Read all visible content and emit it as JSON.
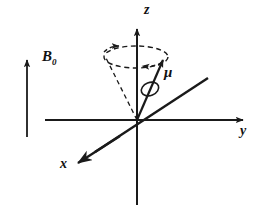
{
  "figure": {
    "name": "larmor-precession-diagram",
    "background": "#ffffff",
    "ink": "#1a1a1a"
  },
  "axes": {
    "z": {
      "label": "z",
      "icon": "axis-arrow-up",
      "x": 147,
      "y": 4
    },
    "y": {
      "label": "y",
      "icon": "axis-arrow-right",
      "x": 243,
      "y": 131
    },
    "x": {
      "label": "x",
      "icon": "axis-arrow-down-left",
      "x": 64,
      "y": 163
    }
  },
  "field": {
    "label": "B",
    "subscript": "0",
    "name": "static-magnetic-field",
    "icon": "field-arrow-up",
    "label_x": 44,
    "label_y": 50
  },
  "moment": {
    "label": "μ",
    "name": "magnetic-moment-vector",
    "icon": "moment-arrow",
    "label_x": 165,
    "label_y": 72
  },
  "precession": {
    "name": "precession-cone",
    "ellipse_label": "precession-circle",
    "arrow_outer": "precession-arrow-cw-far",
    "arrow_inner": "precession-arrow-near",
    "style": "dashed"
  },
  "spin": {
    "name": "spin-loop",
    "icon": "spin-ellipse"
  },
  "geometry": {
    "origin_x": 137,
    "origin_y": 120,
    "ellipse_cx": 136,
    "ellipse_cy": 57,
    "ellipse_rx": 32,
    "ellipse_ry": 11
  }
}
